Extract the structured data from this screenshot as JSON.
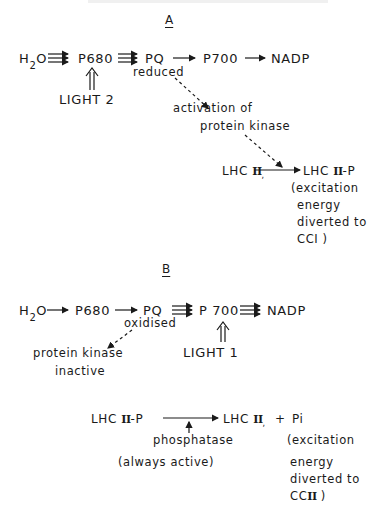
{
  "panel_a": {
    "label": "A",
    "chain": {
      "h2o": "H",
      "h2o_sub": "2",
      "h2o_o": "O",
      "p680": "P680",
      "pq": "PQ",
      "pq_state": "reduced",
      "p700": "P700",
      "nadp": "NADP"
    },
    "light": "LIGHT 2",
    "kinase_line1": "activation of",
    "kinase_line2": "protein kinase",
    "lhc_left": "LHC",
    "lhc_left_roman": "II",
    "lhc_right": "LHC",
    "lhc_right_roman": "II",
    "lhc_right_p": "-P",
    "note": [
      "(excitation",
      "energy",
      "diverted to",
      "CCI )"
    ]
  },
  "panel_b": {
    "label": "B",
    "chain": {
      "h2o": "H",
      "h2o_sub": "2",
      "h2o_o": "O",
      "p680": "P680",
      "pq": "PQ",
      "pq_state": "oxidised",
      "p700": "P 700",
      "nadp": "NADP"
    },
    "kinase_line1": "protein kinase",
    "kinase_line2": "inactive",
    "light": "LIGHT 1",
    "lhc_left": "LHC",
    "lhc_left_roman": "II",
    "lhc_left_p": "-P",
    "lhc_right": "LHC",
    "lhc_right_roman": "II",
    "plus": "+",
    "pi": "Pi",
    "enzyme": "phosphatase",
    "enzyme_note": "(always active)",
    "note": [
      "(excitation",
      "energy",
      "diverted to",
      "CC"
    ],
    "note_roman": "II",
    "note_close": ")"
  },
  "colors": {
    "ink": "#1a1a1a",
    "background": "#ffffff"
  }
}
